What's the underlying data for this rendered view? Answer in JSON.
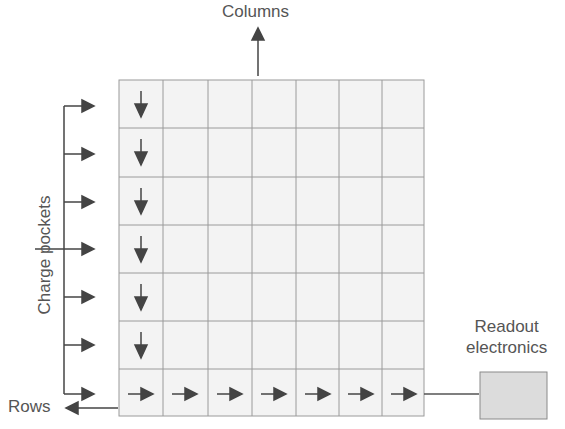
{
  "diagram": {
    "type": "ccd-readout-schematic",
    "labels": {
      "columns": "Columns",
      "rows": "Rows",
      "charge_pockets": "Charge pockets",
      "readout_line1": "Readout",
      "readout_line2": "electronics"
    },
    "grid": {
      "rows": 7,
      "columns": 7,
      "cell_fill": "#f3f3f3",
      "line_color": "#9a9a9a"
    },
    "arrows": {
      "first_column_cells": "down",
      "bottom_row_cells": "right",
      "columns_indicator": "up",
      "rows_indicator": "left",
      "row_feed_arrows": 7
    },
    "colors": {
      "arrow": "#444444",
      "readout_box": "#dcdcdc",
      "text": "#555555"
    }
  }
}
